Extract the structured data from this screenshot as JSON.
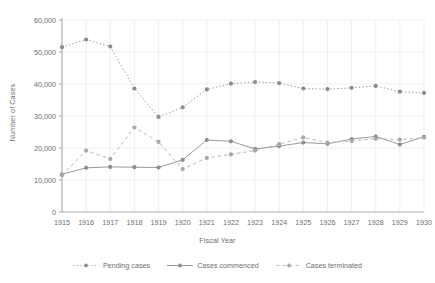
{
  "chart_data": {
    "type": "line",
    "title": "",
    "xlabel": "Fiscal Year",
    "ylabel": "Number of Cases",
    "grid": true,
    "legend_position": "bottom",
    "xlim": [
      1915,
      1930
    ],
    "ylim": [
      0,
      60000
    ],
    "ytick_labels": [
      "0",
      "10,000",
      "20,000",
      "30,000",
      "40,000",
      "50,000",
      "60,000"
    ],
    "ytick_values": [
      0,
      10000,
      20000,
      30000,
      40000,
      50000,
      60000
    ],
    "categories": [
      1915,
      1916,
      1917,
      1918,
      1919,
      1920,
      1921,
      1922,
      1923,
      1924,
      1925,
      1926,
      1927,
      1928,
      1929,
      1930
    ],
    "xtick_labels": [
      "1915",
      "1916",
      "1917",
      "1918",
      "1919",
      "1920",
      "1921",
      "1922",
      "1923",
      "1924",
      "1925",
      "1926",
      "1927",
      "1928",
      "1929",
      "1930"
    ],
    "series": [
      {
        "name": "Pending cases",
        "style": "dotted",
        "color": "#9a9a9a",
        "values": [
          51500,
          53900,
          51700,
          38600,
          29700,
          32700,
          38300,
          40100,
          40600,
          40300,
          38600,
          38400,
          38800,
          39400,
          37600,
          37200
        ]
      },
      {
        "name": "Cases commenced",
        "style": "solid",
        "color": "#9a9a9a",
        "values": [
          11800,
          13800,
          14100,
          14000,
          13900,
          16300,
          22500,
          22100,
          19700,
          20600,
          21700,
          21300,
          22800,
          23600,
          21100,
          23500
        ]
      },
      {
        "name": "Cases terminated",
        "style": "dashed",
        "color": "#b9b9b9",
        "values": [
          11500,
          19200,
          16600,
          26400,
          21900,
          13400,
          16900,
          18000,
          19200,
          21200,
          23300,
          21700,
          22200,
          22900,
          22600,
          23200
        ]
      }
    ]
  },
  "legend": {
    "items": [
      {
        "label": "Pending cases"
      },
      {
        "label": "Cases commenced"
      },
      {
        "label": "Cases terminated"
      }
    ]
  },
  "colors": {
    "axis": "#aaaaaa",
    "grid": "#ebebeb",
    "text": "#6e6e6e",
    "marker": "#8d8d8d",
    "background": "#ffffff"
  }
}
